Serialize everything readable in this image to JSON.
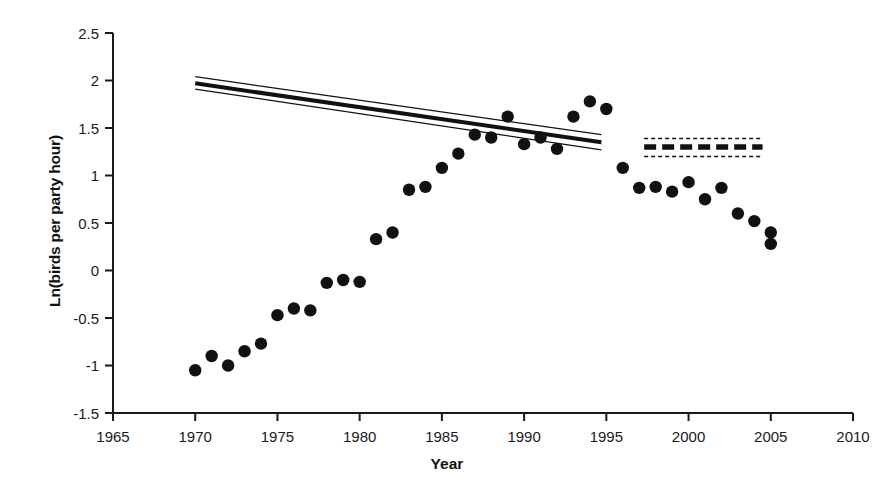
{
  "chart_data": {
    "type": "scatter",
    "title": "",
    "xlabel": "Year",
    "ylabel": "Ln(birds per party hour)",
    "xlim": [
      1965,
      2010
    ],
    "ylim": [
      -1.5,
      2.5
    ],
    "xticks": [
      1965,
      1970,
      1975,
      1980,
      1985,
      1990,
      1995,
      2000,
      2005,
      2010
    ],
    "xtick_labels": [
      "1965",
      "1970",
      "1975",
      "1980",
      "1985",
      "1990",
      "1995",
      "2000",
      "2005",
      "2010"
    ],
    "yticks": [
      -1.5,
      -1,
      -0.5,
      0,
      0.5,
      1,
      1.5,
      2,
      2.5
    ],
    "ytick_labels": [
      "-1.5",
      "-1",
      "-0.5",
      "0",
      "0.5",
      "1",
      "1.5",
      "2",
      "2.5"
    ],
    "grid": false,
    "legend": "none",
    "marker": "filled-circle",
    "marker_color": "#111111",
    "series": [
      {
        "name": "Ln(birds per party hour)",
        "x": [
          1970,
          1971,
          1972,
          1973,
          1974,
          1975,
          1976,
          1977,
          1978,
          1979,
          1980,
          1981,
          1982,
          1983,
          1984,
          1985,
          1986,
          1987,
          1988,
          1989,
          1990,
          1991,
          1992,
          1993,
          1994,
          1995,
          1996,
          1997,
          1998,
          1999,
          2000,
          2001,
          2002,
          2003,
          2004,
          2005
        ],
        "values": [
          -1.05,
          -0.9,
          -1.0,
          -0.85,
          -0.77,
          -0.47,
          -0.4,
          -0.42,
          -0.13,
          -0.1,
          -0.12,
          0.33,
          0.4,
          0.85,
          0.88,
          1.08,
          1.23,
          1.43,
          1.4,
          1.62,
          1.33,
          1.4,
          1.28,
          1.62,
          1.78,
          1.7,
          1.08,
          0.87,
          0.88,
          0.83,
          0.93,
          0.75,
          0.87,
          0.6,
          0.52,
          0.28
        ]
      }
    ],
    "extra_points": [
      {
        "x": 2005,
        "y": 0.4
      }
    ],
    "trend_lines": [
      {
        "name": "declining-trend-solid",
        "style": "solid",
        "x_start": 1970,
        "x_end": 1994.7,
        "y_start": 1.97,
        "y_end": 1.35,
        "ci_upper_start": 2.04,
        "ci_upper_end": 1.43,
        "ci_lower_start": 1.91,
        "ci_lower_end": 1.27
      },
      {
        "name": "flat-trend-dashed",
        "style": "dashed",
        "x_start": 1997.3,
        "x_end": 2004.5,
        "y_start": 1.3,
        "y_end": 1.3,
        "ci_upper_start": 1.39,
        "ci_upper_end": 1.39,
        "ci_lower_start": 1.2,
        "ci_lower_end": 1.2
      }
    ]
  },
  "axes": {
    "x_title": "Year",
    "y_title": "Ln(birds per party hour)"
  }
}
